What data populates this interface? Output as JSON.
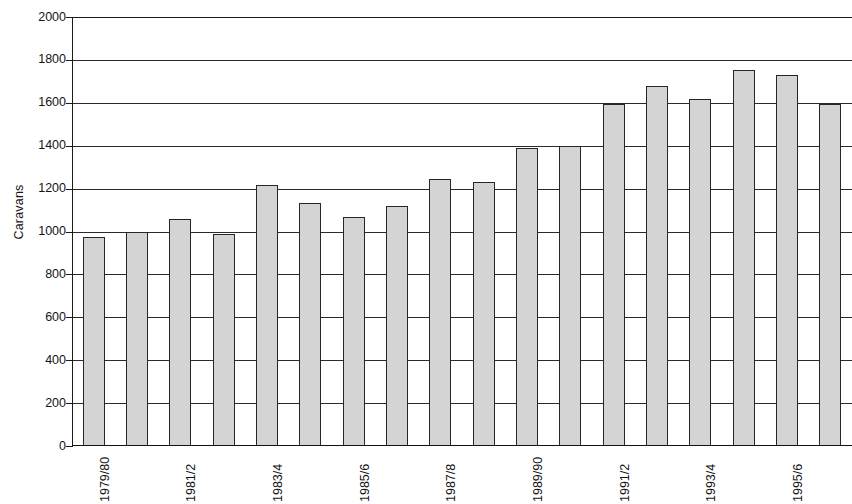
{
  "chart_data": {
    "type": "bar",
    "title": "",
    "xlabel": "",
    "ylabel": "Caravans",
    "ylim": [
      0,
      2000
    ],
    "ytick_step": 200,
    "yticks": [
      2000,
      1800,
      1600,
      1400,
      1200,
      1000,
      800,
      600,
      400,
      200,
      0
    ],
    "ytick_labels": [
      "2000",
      "1800",
      "1600",
      "1400",
      "1200",
      "1000",
      "800",
      "600",
      "400",
      "200",
      "0"
    ],
    "grid": true,
    "grid_axis": "y",
    "legend": "none",
    "bar_color": "#d4d4d4",
    "bar_edge_color": "#262626",
    "axis_color": "#1b1b1b",
    "categories": [
      "1979/80",
      "1980/1",
      "1981/2",
      "1982/3",
      "1983/4",
      "1984/5",
      "1985/6",
      "1986/7",
      "1987/8",
      "1988/9",
      "1989/90",
      "1990/1",
      "1991/2",
      "1992/3",
      "1993/4",
      "1994/5",
      "1995/6",
      "1996/7"
    ],
    "visible_tick_labels": [
      "1979/80",
      "1981/2",
      "1983/4",
      "1985/6",
      "1987/8",
      "1989/90",
      "1991/2",
      "1993/4",
      "1995/6"
    ],
    "visible_tick_indices": [
      0,
      2,
      4,
      6,
      8,
      10,
      12,
      14,
      16
    ],
    "values": [
      975,
      1000,
      1060,
      990,
      1215,
      1135,
      1070,
      1120,
      1245,
      1230,
      1390,
      1400,
      1595,
      1680,
      1620,
      1755,
      1730,
      1595
    ]
  }
}
